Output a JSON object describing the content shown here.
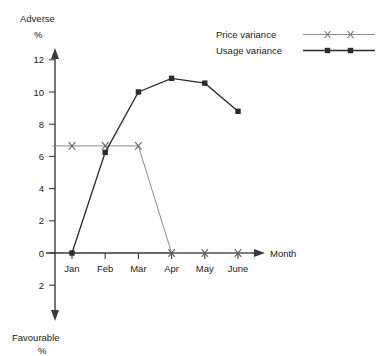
{
  "chart_data": {
    "type": "line",
    "title": "",
    "subtitle": "",
    "xlabel": "Month",
    "ylabel": "%",
    "axis_top_label": "Adverse",
    "axis_top_unit": "%",
    "axis_bottom_label": "Favourable",
    "axis_bottom_unit": "%",
    "categories": [
      "Jan",
      "Feb",
      "Mar",
      "Apr",
      "May",
      "June"
    ],
    "yticks": [
      12,
      10,
      8,
      6,
      4,
      2,
      0,
      2
    ],
    "ytick_labels": [
      "12",
      "10",
      "8",
      "6",
      "4",
      "2",
      "0",
      "2"
    ],
    "ylim": [
      -3,
      13
    ],
    "grid": false,
    "legend_position": "top-right",
    "series": [
      {
        "name": "Price variance",
        "marker": "x",
        "color": "#8c8c8c",
        "values": [
          6.65,
          6.65,
          6.65,
          0,
          0,
          0
        ]
      },
      {
        "name": "Usage variance",
        "marker": "square",
        "color": "#2b2b2b",
        "values": [
          0,
          6.25,
          10.0,
          10.85,
          10.55,
          8.8
        ]
      }
    ]
  },
  "legend": {
    "items": [
      {
        "label": "Price variance"
      },
      {
        "label": "Usage variance"
      }
    ]
  },
  "axes": {
    "x_axis_name": "Month",
    "y_top_text": "Adverse",
    "y_top_percent": "%",
    "y_bottom_text": "Favourable",
    "y_bottom_percent": "%"
  },
  "colors": {
    "price_variance": "#8c8c8c",
    "usage_variance": "#2b2b2b",
    "axis": "#3a3a3a",
    "text": "#1a1a1a",
    "background": "#ffffff"
  }
}
